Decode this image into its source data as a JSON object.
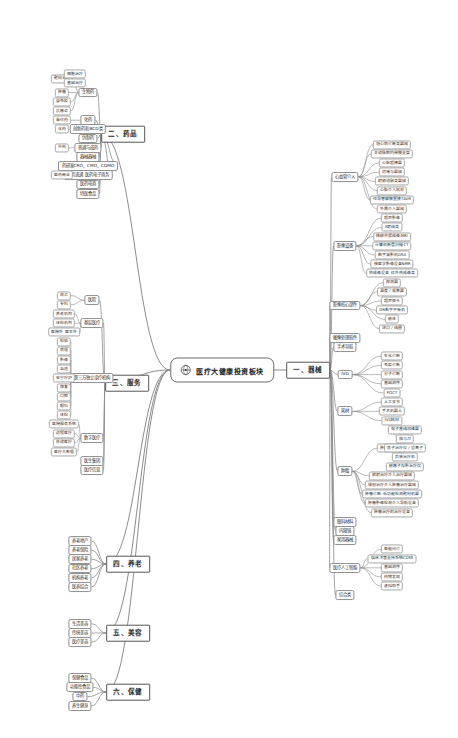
{
  "root": {
    "label": "医疗大健康投资板块",
    "icon": "globe-icon"
  },
  "theme": {
    "node_border": "#9a9a9a",
    "link_stroke": "#8c8c8c",
    "text": "#2b2b2b",
    "background": "#ffffff"
  },
  "branches": [
    {
      "id": "devices",
      "label": "一、器械",
      "side": "right",
      "children": [
        {
          "label": "心血管介入",
          "children": [
            "冠心病诊断类器械",
            "主动脉腔内带膜支架",
            "心脏起搏器",
            "封堵与器械",
            "射频消融类器械",
            "心脏介入耗材",
            "经导管瓣膜置换TAVR",
            "外周介入器械"
          ]
        },
        {
          "label": "影像设备",
          "children": [
            "超声影像",
            "X射线类",
            "核磁共振成像MRI",
            "计算机断层扫描CT",
            "数字减影机DSA",
            "核医学影像设备NMR",
            "热成像设备 红外热成像类"
          ]
        },
        {
          "label": "影像核心部件",
          "children": [
            "探测器",
            "温度 / 采集器",
            "超声探头",
            "DR数字平板机",
            "磁体",
            "进口 / 线圈"
          ]
        },
        {
          "label": "图像处理软件",
          "children": []
        },
        {
          "label": "手术导航",
          "children": []
        },
        {
          "label": "IVD",
          "children": [
            "生化诊断",
            "免疫诊断",
            "分子诊断",
            "基因测序",
            "POCT"
          ]
        },
        {
          "label": "耗材",
          "children": [
            "人工关节",
            "手术机器人",
            "IVD耗材"
          ]
        },
        {
          "label": "肿瘤",
          "children": [
            {
              "label": "肿瘤治疗设备",
              "children": [
                "电子直线加速器",
                "伽马刀",
                "质子治疗仪 / 重离子",
                "后装治疗机",
                "磁感子存影治疗仪"
              ]
            },
            "放射治疗介入治疗器械",
            "微创治疗介入肿瘤治疗器械",
            "肿瘤诊断:低功能检测靶材机器",
            "肿瘤影像检测介入导航设备",
            "肿瘤治疗的治疗设备"
          ]
        },
        {
          "label": "眼科材料",
          "children": []
        },
        {
          "label": "内窥镜",
          "children": []
        },
        {
          "label": "家用器械",
          "children": []
        },
        {
          "label": "医疗人工智能",
          "children": [
            "智能问诊",
            "临床决策支持系统CDSS",
            "基因测序",
            "药物发现",
            "虚拟助手"
          ]
        },
        {
          "label": "综合类",
          "children": []
        }
      ]
    },
    {
      "id": "pharma",
      "label": "二、药品",
      "side": "left",
      "children": [
        {
          "label": "生物药",
          "children": [
            {
              "label": "靶向治疗",
              "children": [
                "细胞治疗",
                "基因治疗"
              ]
            },
            "肿瘤",
            "自免疫",
            "抗感染"
          ]
        },
        {
          "label": "化药",
          "children": [
            "首仿药"
          ]
        },
        {
          "label": "创新药和BCD类",
          "children": [
            "化药"
          ]
        },
        {
          "label": "仿制药",
          "children": []
        },
        {
          "label": "普通与成药",
          "children": [
            "中药"
          ]
        },
        {
          "label": "器械器械",
          "children": []
        },
        {
          "label": "药研发CRO、CMO、CDMO",
          "children": []
        },
        {
          "label": "医药流通 医药电子商务",
          "children": [
            "医药商业"
          ]
        },
        {
          "label": "医药电商",
          "children": []
        },
        {
          "label": "特医食品",
          "children": []
        }
      ]
    },
    {
      "id": "services",
      "label": "三、服务",
      "side": "left",
      "children": [
        {
          "label": "医院",
          "children": [
            "综合",
            "专科"
          ]
        },
        {
          "label": "基层医疗",
          "children": [
            "养老机构",
            "体检机构",
            "医院外 医生外"
          ]
        },
        {
          "label": "第三方独立诊疗机构",
          "children": [
            "检验",
            "病理",
            "影像",
            "血透",
            "安宁疗护",
            "康复",
            "口腔",
            "眼科",
            "体检"
          ]
        },
        {
          "label": "数字医疗",
          "children": [
            "医院服务系统",
            "远程医疗",
            "移动医疗",
            "医疗大数据"
          ]
        },
        {
          "label": "医生集团",
          "children": []
        },
        {
          "label": "医疗信息",
          "children": []
        }
      ]
    },
    {
      "id": "elderly",
      "label": "四、养老",
      "side": "left",
      "children": [
        {
          "label": "养老地产",
          "children": []
        },
        {
          "label": "养老保险",
          "children": []
        },
        {
          "label": "居家养老",
          "children": []
        },
        {
          "label": "社区养老",
          "children": []
        },
        {
          "label": "机构养老",
          "children": []
        },
        {
          "label": "医养结合",
          "children": []
        }
      ]
    },
    {
      "id": "beauty",
      "label": "五、美容",
      "side": "left",
      "children": [
        {
          "label": "生活美容",
          "children": []
        },
        {
          "label": "传统美容",
          "children": []
        },
        {
          "label": "医疗美容",
          "children": []
        }
      ]
    },
    {
      "id": "health",
      "label": "六、保健",
      "side": "left",
      "children": [
        {
          "label": "保健食品",
          "children": []
        },
        {
          "label": "功能性食品",
          "children": []
        },
        {
          "label": "中药",
          "children": []
        },
        {
          "label": "养生健身",
          "children": []
        }
      ]
    }
  ],
  "layout": {
    "root": {
      "x": 222,
      "y": 370
    },
    "branch_pos": {
      "devices": {
        "x": 308,
        "y": 370
      },
      "pharma": {
        "x": 123,
        "y": 134
      },
      "services": {
        "x": 127,
        "y": 383
      },
      "elderly": {
        "x": 128,
        "y": 564
      },
      "beauty": {
        "x": 128,
        "y": 633
      },
      "health": {
        "x": 128,
        "y": 692
      }
    },
    "columns": {
      "devices": {
        "c2": 345,
        "c3": 392,
        "c4": 405
      },
      "pharma": {
        "c2": 88,
        "c3": 62,
        "c4": 75
      },
      "services": {
        "c2": 92,
        "c3": 64,
        "c4": 72
      },
      "elderly": {
        "c2": 80
      },
      "beauty": {
        "c2": 80
      },
      "health": {
        "c2": 80
      }
    }
  }
}
